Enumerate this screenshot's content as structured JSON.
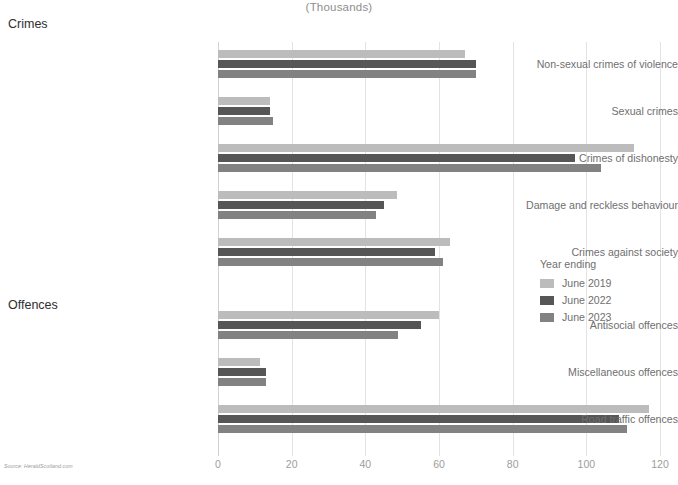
{
  "chart_data": {
    "type": "bar",
    "orientation": "horizontal",
    "title": "(Thousands)",
    "xlabel": "",
    "ylabel": "",
    "xlim": [
      0,
      120
    ],
    "xticks": [
      0,
      20,
      40,
      60,
      80,
      100,
      120
    ],
    "grid": true,
    "legend_title": "Year ending",
    "legend_position": "right-middle",
    "series": [
      {
        "name": "June 2019",
        "color": "#bcbcbc",
        "values": [
          67.0,
          14.0,
          113.0,
          48.5,
          63.0,
          60.0,
          11.5,
          117.0
        ]
      },
      {
        "name": "June 2022",
        "color": "#565656",
        "values": [
          70.0,
          14.0,
          97.0,
          45.0,
          59.0,
          55.0,
          13.0,
          109.0
        ]
      },
      {
        "name": "June 2023",
        "color": "#828282",
        "values": [
          70.0,
          15.0,
          104.0,
          43.0,
          61.0,
          49.0,
          13.0,
          111.0
        ]
      }
    ],
    "categories": [
      "Non-sexual crimes of violence",
      "Sexual crimes",
      "Crimes of dishonesty",
      "Damage and reckless behaviour",
      "Crimes against society",
      "Antisocial offences",
      "Miscellaneous offences",
      "Road traffic offences"
    ],
    "groups": [
      {
        "heading": "Crimes",
        "category_indices": [
          0,
          1,
          2,
          3,
          4
        ]
      },
      {
        "heading": "Offences",
        "category_indices": [
          5,
          6,
          7
        ]
      }
    ],
    "source": "Source: HeraldScotland.com"
  }
}
